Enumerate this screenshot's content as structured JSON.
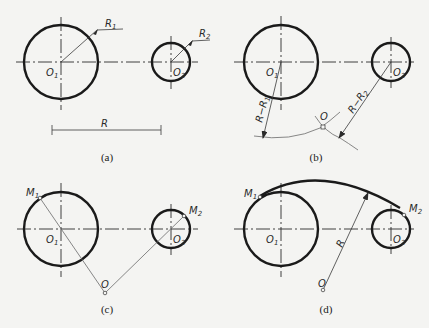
{
  "panels": [
    {
      "caption": "(a)",
      "labels": {
        "o1": "O",
        "o1_sub": "1",
        "o2": "O",
        "o2_sub": "2",
        "r1": "R",
        "r1_sub": "1",
        "r2": "R",
        "r2_sub": "2",
        "r": "R"
      }
    },
    {
      "caption": "(b)",
      "labels": {
        "o1": "O",
        "o1_sub": "1",
        "o2": "O",
        "o2_sub": "2",
        "o": "O",
        "dim1": "R−R",
        "dim1_sub": "1",
        "dim2": "R−R",
        "dim2_sub": "2"
      }
    },
    {
      "caption": "(c)",
      "labels": {
        "o1": "O",
        "o1_sub": "1",
        "o2": "O",
        "o2_sub": "2",
        "o": "O",
        "m1": "M",
        "m1_sub": "1",
        "m2": "M",
        "m2_sub": "2"
      }
    },
    {
      "caption": "(d)",
      "labels": {
        "o1": "O",
        "o1_sub": "1",
        "o2": "O",
        "o2_sub": "2",
        "o": "O",
        "m1": "M",
        "m1_sub": "1",
        "m2": "M",
        "m2_sub": "2",
        "r": "R"
      }
    }
  ]
}
